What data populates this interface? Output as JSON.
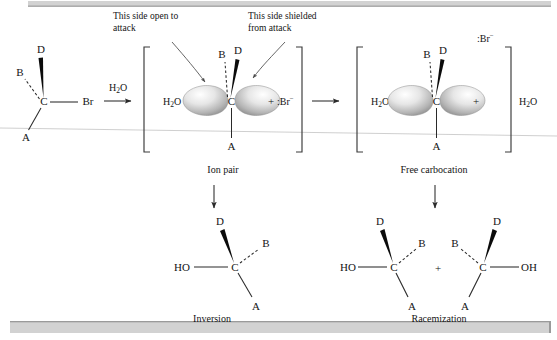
{
  "figure": {
    "type": "reaction-mechanism-diagram",
    "topic": "SN1 solvolysis giving inversion and racemization",
    "annotations": {
      "open_side": "This side open to\nattack",
      "open_side_line1": "This side open to",
      "open_side_line2": "attack",
      "shielded_side_line1": "This side shielded",
      "shielded_side_line2": "from attack"
    },
    "captions": {
      "ion_pair": "Ion pair",
      "free_carbocation": "Free carbocation",
      "inversion": "Inversion",
      "racemization": "Racemization"
    }
  },
  "reactant": {
    "center": "C",
    "substituents": [
      {
        "label": "D",
        "bond": "wedge"
      },
      {
        "label": "B",
        "bond": "dashed"
      },
      {
        "label": "A",
        "bond": "plain"
      },
      {
        "label": "Br",
        "bond": "plain"
      }
    ]
  },
  "step1": {
    "reagent_formula": "H",
    "reagent_sub": "2",
    "reagent_tail": "O",
    "arrow": "right-arrow"
  },
  "ion_pair": {
    "solvent_left": {
      "main": "H",
      "sub": "2",
      "tail": "O"
    },
    "center": "C",
    "charge": "+",
    "up_substituents": [
      {
        "label": "B",
        "bond": "dashed"
      },
      {
        "label": "D",
        "bond": "wedge"
      }
    ],
    "down_substituent": {
      "label": "A",
      "bond": "plain"
    },
    "counterion": {
      "lone_pair": ":",
      "symbol": "Br",
      "charge": "−"
    },
    "orbital": "p-orbital-two-lobes"
  },
  "step2": {
    "arrow": "right-arrow"
  },
  "free_carbocation": {
    "solvent_left": {
      "main": "H",
      "sub": "2",
      "tail": "O"
    },
    "solvent_right": {
      "main": "H",
      "sub": "2",
      "tail": "O"
    },
    "center": "C",
    "charge": "+",
    "up_substituents": [
      {
        "label": "B",
        "bond": "dashed"
      },
      {
        "label": "D",
        "bond": "wedge"
      }
    ],
    "down_substituent": {
      "label": "A",
      "bond": "plain"
    },
    "counterion": {
      "lone_pair": ":",
      "symbol": "Br",
      "charge": "−"
    },
    "orbital": "p-orbital-two-lobes"
  },
  "products": {
    "inversion": {
      "center": "C",
      "hydroxyl": "HO",
      "substituents": [
        {
          "label": "D",
          "bond": "wedge"
        },
        {
          "label": "B",
          "bond": "dashed"
        },
        {
          "label": "A",
          "bond": "plain"
        }
      ]
    },
    "plus_sign": "+",
    "racemization_left": {
      "center": "C",
      "hydroxyl": "HO",
      "substituents": [
        {
          "label": "D",
          "bond": "wedge"
        },
        {
          "label": "B",
          "bond": "dashed"
        },
        {
          "label": "A",
          "bond": "plain"
        }
      ]
    },
    "racemization_right": {
      "center": "C",
      "hydroxyl": "OH",
      "substituents": [
        {
          "label": "D",
          "bond": "wedge"
        },
        {
          "label": "B",
          "bond": "dashed"
        },
        {
          "label": "A",
          "bond": "plain"
        }
      ]
    }
  },
  "colors": {
    "ink": "#141414",
    "bond": "#2a2a2a",
    "bracket": "#3a3a3a",
    "band": "#d2d2d2",
    "orbital_light": "#f2f2f2",
    "orbital_dark": "#9b9b9b",
    "background": "#ffffff"
  }
}
